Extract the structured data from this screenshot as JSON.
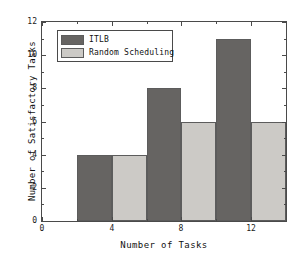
{
  "chart_data": {
    "type": "bar",
    "title": "",
    "xlabel": "Number of Tasks",
    "ylabel": "Number of Satisfactory Tasks",
    "categories": [
      "4",
      "8",
      "12"
    ],
    "series": [
      {
        "name": "ITLB",
        "values": [
          4,
          8,
          11
        ],
        "color": "#666462"
      },
      {
        "name": "Random Scheduling",
        "values": [
          4,
          6,
          6
        ],
        "color": "#cccac6"
      }
    ],
    "xlim": [
      0,
      14
    ],
    "ylim": [
      0,
      12
    ],
    "xticks": [
      "0",
      "4",
      "8",
      "12"
    ],
    "xtick_values": [
      0,
      4,
      8,
      12
    ],
    "yticks": [
      "0",
      "2",
      "4",
      "6",
      "8",
      "10",
      "12"
    ],
    "ytick_values": [
      0,
      2,
      4,
      6,
      8,
      10,
      12
    ],
    "grid": false,
    "legend_position": "upper-left",
    "bar_edge_color": "#5c5c5c",
    "axis_color": "#4a4a4a",
    "background": "#ffffff"
  },
  "legend": {
    "entries": [
      {
        "label": "ITLB",
        "color": "#666462"
      },
      {
        "label": "Random Scheduling",
        "color": "#cccac6"
      }
    ]
  },
  "axes": {
    "x_title": "Number of Tasks",
    "y_title": "Number of Satisfactory Tasks"
  }
}
